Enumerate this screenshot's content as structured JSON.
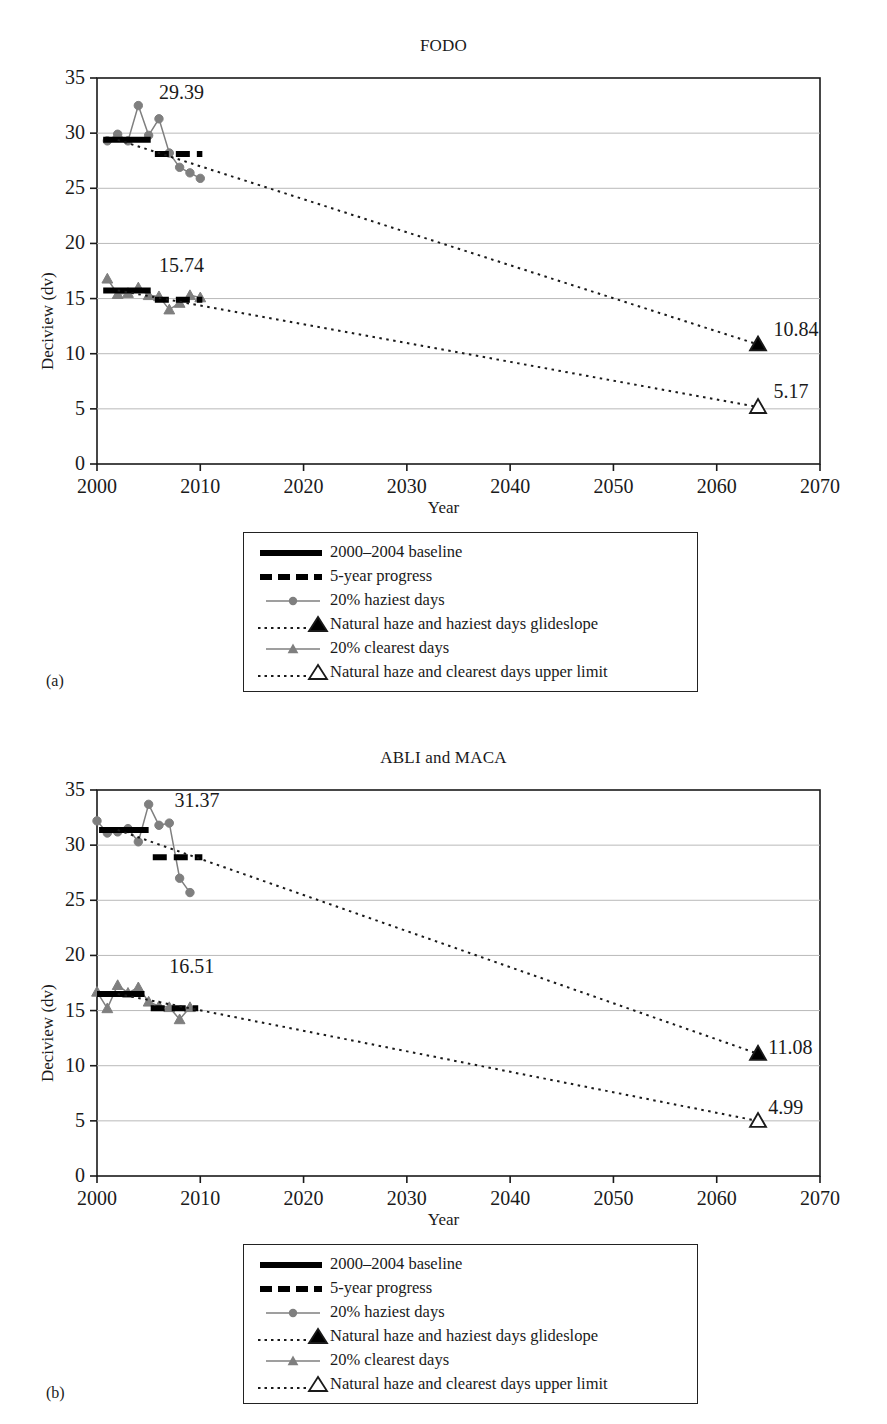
{
  "figure": {
    "panels": [
      {
        "key": "a",
        "panel_label": "(a)",
        "title": "FODO"
      },
      {
        "key": "b",
        "panel_label": "(b)",
        "title": "ABLI and MACA"
      }
    ]
  },
  "axes": {
    "xlabel": "Year",
    "ylabel": "Deciview (dv)",
    "xticks": [
      "2000",
      "2010",
      "2020",
      "2030",
      "2040",
      "2050",
      "2060",
      "2070"
    ],
    "yticks": [
      "0",
      "5",
      "10",
      "15",
      "20",
      "25",
      "30",
      "35"
    ]
  },
  "legend": {
    "items": [
      {
        "key": "baseline",
        "label": "2000–2004 baseline"
      },
      {
        "key": "progress",
        "label": "5-year progress"
      },
      {
        "key": "haziest",
        "label": "20% haziest days"
      },
      {
        "key": "haziest-glideslope",
        "label": "Natural haze and haziest days glideslope"
      },
      {
        "key": "clearest",
        "label": "20% clearest days"
      },
      {
        "key": "clearest-limit",
        "label": "Natural haze and clearest days upper limit"
      }
    ]
  },
  "colors": {
    "axis": "#1a1a1a",
    "grid": "#b9b9b9",
    "baseline": "#000000",
    "progress": "#000000",
    "observed": "#7f7f7f",
    "glideslope": "#1a1a1a",
    "natural_fill_haziest": "#000000",
    "natural_fill_clearest": "#ffffff"
  },
  "chart_data": [
    {
      "type": "line",
      "panel": "a",
      "title": "FODO",
      "xlabel": "Year",
      "ylabel": "Deciview (dv)",
      "xlim": [
        2000,
        2070
      ],
      "ylim": [
        0,
        35
      ],
      "xtick_step": 10,
      "ytick_step": 5,
      "grid": true,
      "legend_position": "below-plot",
      "annotations": [
        {
          "text": "29.39",
          "x": 2006.0,
          "y": 33.1,
          "refers_to": "haziest-baseline"
        },
        {
          "text": "15.74",
          "x": 2006.0,
          "y": 17.4,
          "refers_to": "clearest-baseline"
        },
        {
          "text": "10.84",
          "x": 2065.5,
          "y": 11.6,
          "refers_to": "haziest-glideslope-endpoint"
        },
        {
          "text": "5.17",
          "x": 2065.5,
          "y": 6.0,
          "refers_to": "clearest-limit-endpoint"
        }
      ],
      "series": [
        {
          "name": "20% haziest days",
          "style": "line-marker-circle",
          "color": "#7f7f7f",
          "x": [
            2001,
            2002,
            2003,
            2004,
            2005,
            2006,
            2007,
            2008,
            2009,
            2010
          ],
          "values": [
            29.3,
            29.9,
            29.3,
            32.5,
            29.8,
            31.3,
            28.2,
            26.9,
            26.4,
            25.9
          ]
        },
        {
          "name": "20% clearest days",
          "style": "line-marker-triangle",
          "color": "#7f7f7f",
          "x": [
            2001,
            2002,
            2003,
            2004,
            2005,
            2006,
            2007,
            2008,
            2009,
            2010
          ],
          "values": [
            16.8,
            15.4,
            15.5,
            16.0,
            15.3,
            15.2,
            14.0,
            14.6,
            15.3,
            15.1
          ]
        },
        {
          "name": "2000–2004 baseline (haziest)",
          "style": "thick-solid",
          "color": "#000000",
          "x": [
            2000.6,
            2005.2
          ],
          "values": [
            29.39,
            29.39
          ]
        },
        {
          "name": "2000–2004 baseline (clearest)",
          "style": "thick-solid",
          "color": "#000000",
          "x": [
            2000.6,
            2005.2
          ],
          "values": [
            15.74,
            15.74
          ]
        },
        {
          "name": "5-year progress (haziest)",
          "style": "thick-dashed",
          "color": "#000000",
          "x": [
            2005.6,
            2010.2
          ],
          "values": [
            28.1,
            28.1
          ]
        },
        {
          "name": "5-year progress (clearest)",
          "style": "thick-dashed",
          "color": "#000000",
          "x": [
            2005.6,
            2010.2
          ],
          "values": [
            14.9,
            14.9
          ]
        },
        {
          "name": "Natural haze and haziest days glideslope",
          "style": "dotted-endpoint-filled-triangle",
          "color": "#1a1a1a",
          "x": [
            2002,
            2064
          ],
          "values": [
            29.39,
            10.84
          ]
        },
        {
          "name": "Natural haze and clearest days upper limit",
          "style": "dotted-endpoint-open-triangle",
          "color": "#1a1a1a",
          "x": [
            2002,
            2064
          ],
          "values": [
            15.74,
            5.17
          ]
        }
      ]
    },
    {
      "type": "line",
      "panel": "b",
      "title": "ABLI and MACA",
      "xlabel": "Year",
      "ylabel": "Deciview (dv)",
      "xlim": [
        2000,
        2070
      ],
      "ylim": [
        0,
        35
      ],
      "xtick_step": 10,
      "ytick_step": 5,
      "grid": true,
      "legend_position": "below-plot",
      "annotations": [
        {
          "text": "31.37",
          "x": 2007.5,
          "y": 33.5,
          "refers_to": "haziest-baseline"
        },
        {
          "text": "16.51",
          "x": 2007.0,
          "y": 18.4,
          "refers_to": "clearest-baseline"
        },
        {
          "text": "11.08",
          "x": 2065.0,
          "y": 11.1,
          "refers_to": "haziest-glideslope-endpoint"
        },
        {
          "text": "4.99",
          "x": 2065.0,
          "y": 5.6,
          "refers_to": "clearest-limit-endpoint"
        }
      ],
      "series": [
        {
          "name": "20% haziest days",
          "style": "line-marker-circle",
          "color": "#7f7f7f",
          "x": [
            2000,
            2001,
            2002,
            2003,
            2004,
            2005,
            2006,
            2007,
            2008,
            2009
          ],
          "values": [
            32.2,
            31.1,
            31.2,
            31.5,
            30.3,
            33.7,
            31.8,
            32.0,
            27.0,
            25.7
          ]
        },
        {
          "name": "20% clearest days",
          "style": "line-marker-triangle",
          "color": "#7f7f7f",
          "x": [
            2000,
            2001,
            2002,
            2003,
            2004,
            2005,
            2006,
            2007,
            2008,
            2009
          ],
          "values": [
            16.7,
            15.2,
            17.3,
            16.6,
            17.1,
            15.8,
            15.4,
            15.3,
            14.2,
            15.3
          ]
        },
        {
          "name": "2000–2004 baseline (haziest)",
          "style": "thick-solid",
          "color": "#000000",
          "x": [
            2000.2,
            2005.0
          ],
          "values": [
            31.37,
            31.37
          ]
        },
        {
          "name": "2000–2004 baseline (clearest)",
          "style": "thick-solid",
          "color": "#000000",
          "x": [
            2000.0,
            2004.6
          ],
          "values": [
            16.51,
            16.51
          ]
        },
        {
          "name": "5-year progress (haziest)",
          "style": "thick-dashed",
          "color": "#000000",
          "x": [
            2005.4,
            2010.2
          ],
          "values": [
            28.9,
            28.9
          ]
        },
        {
          "name": "5-year progress (clearest)",
          "style": "thick-dashed",
          "color": "#000000",
          "x": [
            2005.2,
            2009.8
          ],
          "values": [
            15.2,
            15.2
          ]
        },
        {
          "name": "Natural haze and haziest days glideslope",
          "style": "dotted-endpoint-filled-triangle",
          "color": "#1a1a1a",
          "x": [
            2002,
            2064
          ],
          "values": [
            31.37,
            11.08
          ]
        },
        {
          "name": "Natural haze and clearest days upper limit",
          "style": "dotted-endpoint-open-triangle",
          "color": "#1a1a1a",
          "x": [
            2002,
            2064
          ],
          "values": [
            16.51,
            4.99
          ]
        }
      ]
    }
  ]
}
